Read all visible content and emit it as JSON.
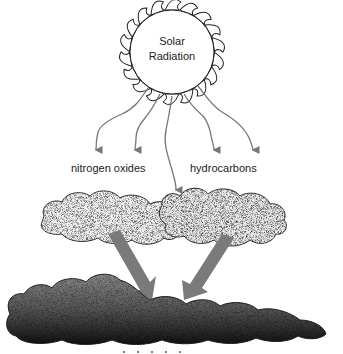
{
  "diagram": {
    "source": {
      "label_line1": "Solar",
      "label_line2": "Radiation"
    },
    "inputs": [
      {
        "label": "nitrogen oxides"
      },
      {
        "label": "hydrocarbons"
      }
    ],
    "arrow_color": "#7a7a7a",
    "ray_color": "#777777",
    "ray_count": 5,
    "clouds": [
      "nitrogen-oxides-cloud",
      "hydrocarbons-cloud",
      "result-cloud"
    ],
    "bottom_label_cut_off": true
  }
}
